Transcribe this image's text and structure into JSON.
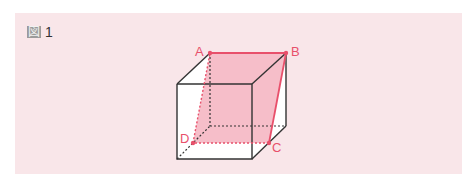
{
  "figure": {
    "kanji": "図",
    "number": "1"
  },
  "colors": {
    "panel_bg": "#f9e6e9",
    "accent": "#e8506b",
    "fill": "#f4b3c0",
    "edge": "#333333"
  },
  "vertices": {
    "A": "A",
    "B": "B",
    "C": "C",
    "D": "D"
  }
}
